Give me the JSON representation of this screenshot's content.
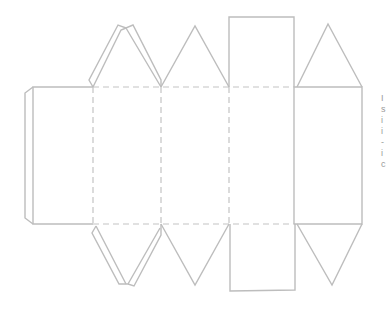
{
  "figure": {
    "line_colors": {
      "cut": "#bdbdbd",
      "fold": "#c4c4c4"
    },
    "panels": [
      {
        "name": "panel-1",
        "x": 33,
        "y": 87,
        "w": 60,
        "h": 137
      },
      {
        "name": "panel-2",
        "x": 93,
        "y": 87,
        "w": 68,
        "h": 137
      },
      {
        "name": "panel-3",
        "x": 161,
        "y": 87,
        "w": 68,
        "h": 137
      },
      {
        "name": "panel-4",
        "x": 229,
        "y": 87,
        "w": 65,
        "h": 137
      }
    ],
    "glue_flap": {
      "side": "left"
    },
    "top_flaps": [
      "double-triangle",
      "triangle",
      "square",
      "triangle"
    ],
    "bottom_flaps": [
      "double-triangle",
      "triangle",
      "square",
      "triangle"
    ]
  },
  "edge_text": {
    "chars": [
      "I",
      "s",
      "i",
      "i",
      "-",
      "i",
      "c"
    ]
  }
}
